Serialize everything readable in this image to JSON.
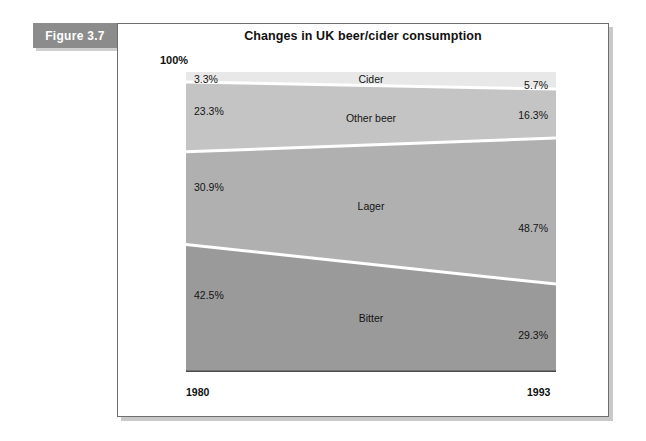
{
  "figure": {
    "tab_label": "Figure 3.7"
  },
  "chart_data": {
    "type": "area",
    "title": "Changes in UK beer/cider consumption",
    "xlabel": "",
    "ylabel": "",
    "ylim": [
      0,
      100
    ],
    "axis_top_label": "100%",
    "grid": false,
    "legend": "inline-band-labels",
    "stacked": true,
    "normalized_percent": true,
    "categories": [
      "1980",
      "1993"
    ],
    "x_tick_labels": [
      "1980",
      "1993"
    ],
    "series": [
      {
        "name": "Cider",
        "values": [
          3.3,
          5.7
        ],
        "value_labels": [
          "3.3%",
          "5.7%"
        ],
        "color": "#e8e8e8"
      },
      {
        "name": "Other beer",
        "values": [
          23.3,
          16.3
        ],
        "value_labels": [
          "23.3%",
          "16.3%"
        ],
        "color": "#c4c4c4"
      },
      {
        "name": "Lager",
        "values": [
          30.9,
          48.7
        ],
        "value_labels": [
          "30.9%",
          "48.7%"
        ],
        "color": "#b0b0b0"
      },
      {
        "name": "Bitter",
        "values": [
          42.5,
          29.3
        ],
        "value_labels": [
          "42.5%",
          "29.3%"
        ],
        "color": "#9a9a9a"
      }
    ]
  }
}
